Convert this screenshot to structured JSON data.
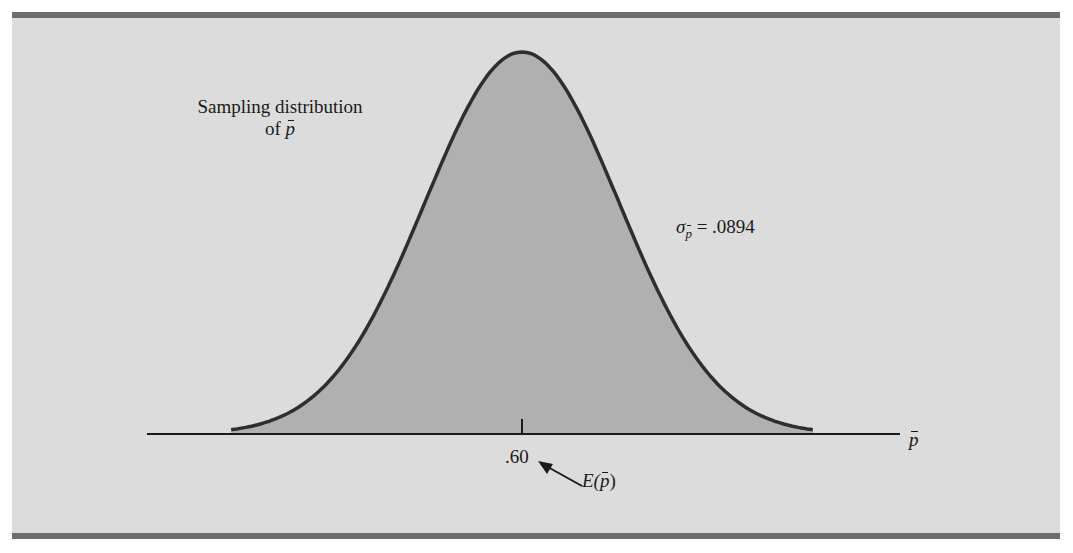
{
  "figure": {
    "title_line1": "Sampling distribution",
    "title_line2_prefix": "of ",
    "title_line2_var": "p",
    "sigma_symbol": "σ",
    "sigma_subscript": "p",
    "sigma_value_text": " = .0894",
    "tick_label": ".60",
    "expected_value_prefix": "E(",
    "expected_value_var": "p",
    "expected_value_suffix": ")",
    "axis_variable": "p"
  },
  "colors": {
    "background": "#dcdcdc",
    "frame_bars": "#6e6e6e",
    "curve_fill": "#b0b0b0",
    "curve_stroke": "#2e2e2e",
    "axis": "#1a1a1a"
  },
  "chart_data": {
    "type": "area",
    "xlabel": "p̄",
    "ylabel": "",
    "distribution": "normal",
    "mean": 0.6,
    "std_error": 0.0894,
    "x_range": [
      0.332,
      0.868
    ],
    "x_ticks": [
      0.6
    ],
    "x_tick_labels": [
      ".60"
    ],
    "annotations": [
      {
        "text": "Sampling distribution of p̄",
        "position": "upper-left"
      },
      {
        "text": "σ_p̄ = .0894",
        "position": "right of curve"
      },
      {
        "text": "E(p̄)",
        "points_to": ".60",
        "arrow": true
      }
    ],
    "grid": false,
    "legend": null
  }
}
